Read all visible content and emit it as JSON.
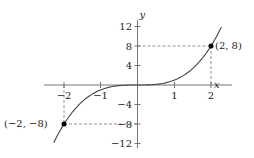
{
  "chart_data": {
    "type": "line",
    "title": "",
    "function": "y = x^3",
    "xlabel": "x",
    "ylabel": "y",
    "xlim": [
      -2.5,
      2.5
    ],
    "ylim": [
      -13,
      13
    ],
    "x_ticks": [
      -2,
      -1,
      1,
      2
    ],
    "x_tick_labels": [
      "−2",
      "−1",
      "1",
      "2"
    ],
    "y_ticks": [
      12,
      8,
      4,
      -4,
      -8,
      -12
    ],
    "y_tick_labels": [
      "12",
      "8",
      "4",
      "−4",
      "−8",
      "−12"
    ],
    "grid": false,
    "series": [
      {
        "name": "y = x^3",
        "x": [
          -2.28,
          -2,
          -1.5,
          -1,
          -0.5,
          0,
          0.5,
          1,
          1.5,
          2,
          2.28
        ],
        "y": [
          -11.85,
          -8,
          -3.375,
          -1,
          -0.125,
          0,
          0.125,
          1,
          3.375,
          8,
          11.85
        ]
      }
    ],
    "annotations": [
      {
        "x": 2,
        "y": 8,
        "text": "(2, 8)"
      },
      {
        "x": -2,
        "y": -8,
        "text": "(−2, −8)"
      }
    ]
  },
  "labels": {
    "x_axis": "x",
    "y_axis": "y",
    "point_pos": "(2, 8)",
    "point_neg": "(−2, −8)",
    "xt_m2": "−2",
    "xt_m1": "−1",
    "xt_1": "1",
    "xt_2": "2",
    "yt_12": "12",
    "yt_8": "8",
    "yt_4": "4",
    "yt_m4": "−4",
    "yt_m8": "−8",
    "yt_m12": "−12"
  },
  "colors": {
    "axis": "#555555",
    "curve": "#444444",
    "dash": "#666666",
    "point": "#000000"
  }
}
